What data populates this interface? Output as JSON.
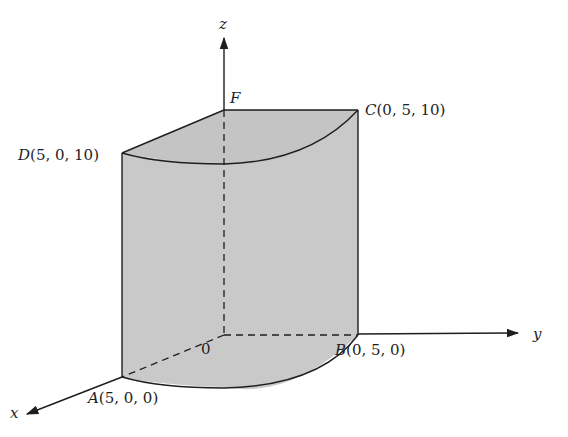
{
  "diagram": {
    "colors": {
      "background": "#ffffff",
      "solid_fill": "#c9c9c9",
      "stroke": "#1e1e1e"
    },
    "axes": {
      "x_label": "x",
      "y_label": "y",
      "z_label": "z"
    },
    "origin_label": "0",
    "points": {
      "F": {
        "name": "F",
        "coords": ""
      },
      "C": {
        "name": "C",
        "coords": "(0, 5, 10)"
      },
      "D": {
        "name": "D",
        "coords": "(5, 0, 10)"
      },
      "A": {
        "name": "A",
        "coords": "(5, 0, 0)"
      },
      "B": {
        "name": "B",
        "coords": "(0, 5, 0)"
      }
    }
  }
}
